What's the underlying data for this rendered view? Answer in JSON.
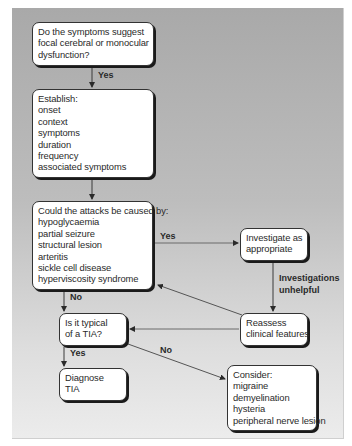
{
  "diagram": {
    "nodes": {
      "focal_question": {
        "lines": [
          "Do the symptoms suggest",
          "focal cerebral or monocular",
          "dysfunction?"
        ]
      },
      "establish": {
        "lines": [
          "Establish:",
          "onset",
          "context",
          "symptoms",
          "duration",
          "frequency",
          "associated symptoms"
        ]
      },
      "attacks_cause": {
        "lines": [
          "Could the attacks be caused by:",
          "hypoglycaemia",
          "partial seizure",
          "structural lesion",
          "arteritis",
          "sickle cell disease",
          "hyperviscosity syndrome"
        ]
      },
      "investigate": {
        "lines": [
          "Investigate as",
          "appropriate"
        ]
      },
      "reassess": {
        "lines": [
          "Reassess",
          "clinical features"
        ]
      },
      "typical_tia": {
        "lines": [
          "Is it typical",
          "of a TIA?"
        ]
      },
      "diagnose_tia": {
        "lines": [
          "Diagnose",
          "TIA"
        ]
      },
      "consider": {
        "lines": [
          "Consider:",
          "migraine",
          "demyelination",
          "hysteria",
          "peripheral nerve lesion"
        ]
      }
    },
    "edge_labels": {
      "focal_yes": "Yes",
      "attacks_yes": "Yes",
      "attacks_no": "No",
      "investigations_unhelpful_1": "Investigations",
      "investigations_unhelpful_2": "unhelpful",
      "typical_yes": "Yes",
      "typical_no": "No"
    },
    "colors": {
      "line": "#3a3a3a",
      "box_fill": "#ffffff",
      "text": "#2a2a2a"
    }
  }
}
